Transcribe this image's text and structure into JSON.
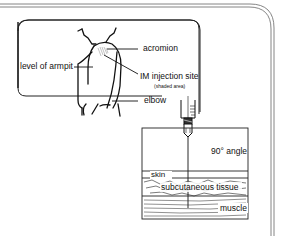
{
  "figure": {
    "arm_panel": {
      "labels": {
        "acromion": "acromion",
        "armpit": "level of armpit",
        "injection_site": "IM injection site",
        "injection_site_note": "(shaded area)",
        "elbow": "elbow"
      }
    },
    "tissue_panel": {
      "labels": {
        "angle": "90° angle",
        "skin": "skin",
        "subcutaneous": "subcutaneous tissue",
        "muscle": "muscle"
      }
    }
  },
  "colors": {
    "line": "#111111",
    "frame": "#555555",
    "shade": "#bbbbbb",
    "background": "#ffffff"
  }
}
